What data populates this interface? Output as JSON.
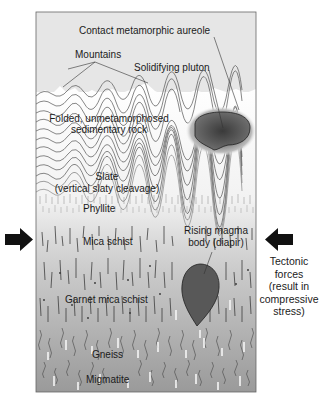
{
  "diagram": {
    "type": "geological cross-section",
    "colors": {
      "sky": "#e4e4e4",
      "frame": "#555555",
      "rock_light": "#f4f4f4",
      "rock_deep": "#9c9c9c",
      "pluton": "#5e5e5e",
      "diapir": "#555555",
      "arrow": "#111111"
    },
    "labels": {
      "aureole": "Contact metamorphic aureole",
      "mountains": "Mountains",
      "pluton": "Solidifying pluton",
      "sedimentary_line1": "Folded, unmetamorphosed",
      "sedimentary_line2": "sedimentary rock",
      "slate_line1": "Slate",
      "slate_line2": "(vertical slaty cleavage)",
      "phyllite": "Phyllite",
      "mica_schist": "Mica schist",
      "diapir_line1": "Rising magma",
      "diapir_line2": "body (diapir)",
      "garnet_mica_schist": "Garnet mica schist",
      "gneiss": "Gneiss",
      "migmatite": "Migmatite"
    },
    "tectonic": {
      "lines": [
        "Tectonic",
        "forces",
        "(result in",
        "compressive",
        "stress)"
      ],
      "left_arrow": "arrow-right-icon",
      "right_arrow": "arrow-left-icon"
    },
    "layers_top_to_bottom": [
      "Mountains",
      "Folded, unmetamorphosed sedimentary rock",
      "Slate (vertical slaty cleavage)",
      "Phyllite",
      "Mica schist",
      "Garnet mica schist",
      "Gneiss",
      "Migmatite"
    ]
  }
}
